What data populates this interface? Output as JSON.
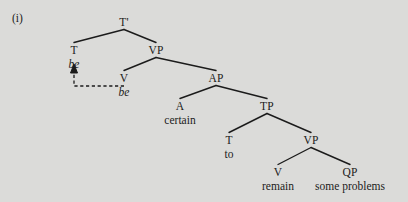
{
  "figure": {
    "example_number": "(i)",
    "background_color": "#dbdbd9",
    "ink_color": "#1b1b1b"
  },
  "tree": {
    "nodes": [
      {
        "id": "tbar",
        "label": "T'",
        "x": 124,
        "y": 16
      },
      {
        "id": "t1",
        "label": "T",
        "x": 74,
        "y": 44
      },
      {
        "id": "vp1",
        "label": "VP",
        "x": 156,
        "y": 44
      },
      {
        "id": "v1",
        "label": "V",
        "x": 124,
        "y": 72
      },
      {
        "id": "ap",
        "label": "AP",
        "x": 216,
        "y": 72
      },
      {
        "id": "a",
        "label": "A",
        "x": 180,
        "y": 100
      },
      {
        "id": "tp",
        "label": "TP",
        "x": 267,
        "y": 100
      },
      {
        "id": "t2",
        "label": "T",
        "x": 229,
        "y": 134
      },
      {
        "id": "vp2",
        "label": "VP",
        "x": 311,
        "y": 134
      },
      {
        "id": "v2",
        "label": "V",
        "x": 278,
        "y": 166
      },
      {
        "id": "qp",
        "label": "QP",
        "x": 350,
        "y": 166
      }
    ],
    "terminals": [
      {
        "id": "be-moved",
        "label": "be",
        "x": 74,
        "y": 58,
        "style": "italic"
      },
      {
        "id": "be-trace",
        "label": "be",
        "x": 124,
        "y": 86,
        "style": "italic"
      },
      {
        "id": "certain",
        "label": "certain",
        "x": 180,
        "y": 114,
        "style": "roman"
      },
      {
        "id": "to",
        "label": "to",
        "x": 229,
        "y": 148,
        "style": "roman"
      },
      {
        "id": "remain",
        "label": "remain",
        "x": 278,
        "y": 180,
        "style": "roman"
      },
      {
        "id": "some-problems",
        "label": "some problems",
        "x": 350,
        "y": 180,
        "style": "roman"
      }
    ],
    "branches": [
      {
        "from": "tbar",
        "to": "t1"
      },
      {
        "from": "tbar",
        "to": "vp1"
      },
      {
        "from": "vp1",
        "to": "v1"
      },
      {
        "from": "vp1",
        "to": "ap"
      },
      {
        "from": "ap",
        "to": "a"
      },
      {
        "from": "ap",
        "to": "tp"
      },
      {
        "from": "tp",
        "to": "t2"
      },
      {
        "from": "tp",
        "to": "vp2"
      },
      {
        "from": "vp2",
        "to": "v2"
      },
      {
        "from": "vp2",
        "to": "qp"
      }
    ],
    "movement_arrow": {
      "description": "dashed movement line from trace position up to moved head",
      "start_x": 124,
      "start_y": 86,
      "corner_x": 74,
      "corner_y": 86,
      "end_x": 74,
      "end_y": 64
    }
  }
}
